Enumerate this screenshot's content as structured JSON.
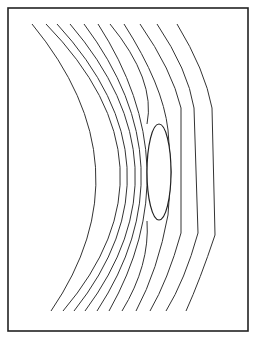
{
  "figure": {
    "frame": {
      "x": 8,
      "y": 8,
      "width": 240,
      "height": 323,
      "stroke": "#222222"
    },
    "lens": {
      "cx": 159,
      "cy": 172,
      "rx": 12,
      "ry": 48,
      "stroke": "#222222"
    },
    "wavefront_count": 11,
    "wavefronts": [
      {
        "id": 1,
        "d": "M32,24 Q149.5,167 51,311"
      },
      {
        "id": 2,
        "d": "M46,24 Q185.5,167 63,311"
      },
      {
        "id": 3,
        "d": "M57,24 Q188.5,167 74,311"
      },
      {
        "id": 4,
        "d": "M70,24 Q192.5,167 85,311"
      },
      {
        "id": 5,
        "d": "M84,24 Q191.5,167 97,311"
      },
      {
        "id": 6,
        "d": "M98,24 Q190.5,167 109,311"
      },
      {
        "id": 7,
        "d": "M110,24 Q156,80 147,124 M147,221 Q150,265 122,311"
      },
      {
        "id": 8,
        "d": "M124,24 Q163,85 168,130 L171,172 L168,215 Q158,270 136,311"
      },
      {
        "id": 9,
        "d": "M140,24 Q172,70 181,108 L181,233 Q168,280 150,311"
      },
      {
        "id": 10,
        "d": "M157,24 Q188,70 194,108 L198,233 Q185,280 166,311"
      },
      {
        "id": 11,
        "d": "M177,24 Q205,70 212,108 L215,235 Q200,280 186,311"
      }
    ]
  }
}
